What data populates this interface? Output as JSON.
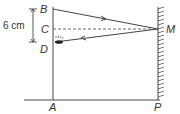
{
  "diagram": {
    "labels": {
      "B": "B",
      "C": "C",
      "D": "D",
      "M": "M",
      "A": "A",
      "P": "P"
    },
    "dimension": "6 cm",
    "colors": {
      "line": "#444444",
      "text": "#333333"
    }
  }
}
